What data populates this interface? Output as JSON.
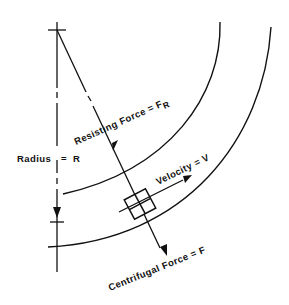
{
  "diagram": {
    "type": "curve-forces-diagram",
    "colors": {
      "ink": "#111111",
      "background": "#ffffff"
    },
    "labels": {
      "radius": "Radius",
      "radius_eq": "=",
      "radius_sym": "R",
      "resisting": "Resisting Force = F",
      "resisting_sub": "R",
      "velocity": "Velocity = V",
      "centrifugal": "Centrifugal Force = F"
    },
    "elements": [
      "center-mark",
      "radius-line",
      "inner-curve-edge",
      "outer-curve-edge",
      "vehicle-box",
      "resisting-force-arrow",
      "velocity-arrow",
      "centrifugal-force-arrow"
    ]
  }
}
